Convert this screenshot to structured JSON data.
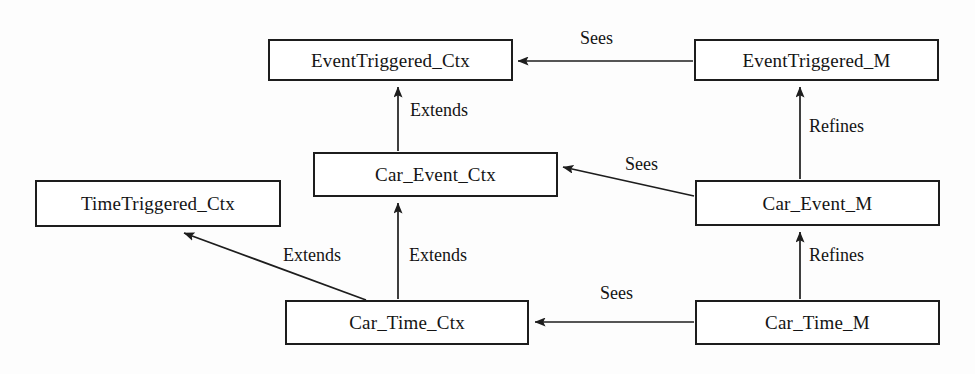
{
  "diagram": {
    "stroke_color": "#1d1d1d",
    "background_color": "#fdfdfd",
    "nodes": [
      {
        "id": "eventtriggered_ctx",
        "label": "EventTriggered_Ctx",
        "kind": "context"
      },
      {
        "id": "eventtriggered_m",
        "label": "EventTriggered_M",
        "kind": "machine"
      },
      {
        "id": "car_event_ctx",
        "label": "Car_Event_Ctx",
        "kind": "context"
      },
      {
        "id": "timetriggered_ctx",
        "label": "TimeTriggered_Ctx",
        "kind": "context"
      },
      {
        "id": "car_event_m",
        "label": "Car_Event_M",
        "kind": "machine"
      },
      {
        "id": "car_time_ctx",
        "label": "Car_Time_Ctx",
        "kind": "context"
      },
      {
        "id": "car_time_m",
        "label": "Car_Time_M",
        "kind": "machine"
      }
    ],
    "edges": [
      {
        "id": "e1",
        "from": "eventtriggered_m",
        "to": "eventtriggered_ctx",
        "label": "Sees"
      },
      {
        "id": "e2",
        "from": "car_event_ctx",
        "to": "eventtriggered_ctx",
        "label": "Extends"
      },
      {
        "id": "e3",
        "from": "car_event_m",
        "to": "eventtriggered_m",
        "label": "Refines"
      },
      {
        "id": "e4",
        "from": "car_event_m",
        "to": "car_event_ctx",
        "label": "Sees"
      },
      {
        "id": "e5",
        "from": "car_time_ctx",
        "to": "car_event_ctx",
        "label": "Extends"
      },
      {
        "id": "e6",
        "from": "car_time_ctx",
        "to": "timetriggered_ctx",
        "label": "Extends"
      },
      {
        "id": "e7",
        "from": "car_time_m",
        "to": "car_event_m",
        "label": "Refines"
      },
      {
        "id": "e8",
        "from": "car_time_m",
        "to": "car_time_ctx",
        "label": "Sees"
      }
    ],
    "edge_labels": {
      "sees_top": "Sees",
      "extends_upper": "Extends",
      "refines_upper": "Refines",
      "sees_middle": "Sees",
      "extends_left": "Extends",
      "extends_right": "Extends",
      "sees_bottom": "Sees",
      "refines_lower": "Refines"
    }
  }
}
